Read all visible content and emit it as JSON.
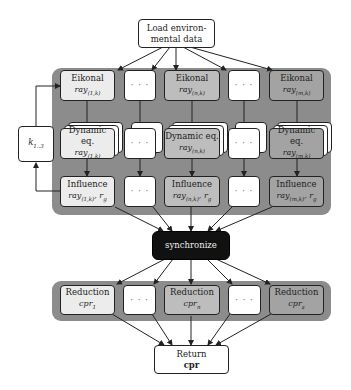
{
  "start": {
    "line1": "Load environ-",
    "line2": "mental data"
  },
  "loop": {
    "label": "k",
    "sub": "1..3"
  },
  "columns": [
    {
      "eikonal": "Eikonal",
      "eikonal_ray": "ray",
      "eikonal_sub": "(1,k)",
      "dyn": "Dynamic eq.",
      "dyn_ray": "ray",
      "dyn_sub": "(1,k)",
      "infl": "Influence",
      "infl_ray": "ray",
      "infl_sub": "(1,k)",
      "infl_extra": ", r",
      "infl_extra_sub": "g"
    },
    {
      "eikonal": "Eikonal",
      "eikonal_ray": "ray",
      "eikonal_sub": "(n,k)",
      "dyn": "Dynamic eq.",
      "dyn_ray": "ray",
      "dyn_sub": "(n,k)",
      "infl": "Influence",
      "infl_ray": "ray",
      "infl_sub": "(n,k)",
      "infl_extra": ", r",
      "infl_extra_sub": "g"
    },
    {
      "eikonal": "Eikonal",
      "eikonal_ray": "ray",
      "eikonal_sub": "(m,k)",
      "dyn": "Dynamic eq.",
      "dyn_ray": "ray",
      "dyn_sub": "(m,k)",
      "infl": "Influence",
      "infl_ray": "ray",
      "infl_sub": "(m,k)",
      "infl_extra": ", r",
      "infl_extra_sub": "g"
    }
  ],
  "ellipsis": "· · ·",
  "sync": {
    "label": "synchronize"
  },
  "reductions": [
    {
      "label": "Reduction",
      "var": "cpr",
      "sub": "1"
    },
    {
      "label": "Reduction",
      "var": "cpr",
      "sub": "n"
    },
    {
      "label": "Reduction",
      "var": "cpr",
      "sub": "z"
    }
  ],
  "end": {
    "line1": "Return",
    "line2": "cpr"
  }
}
